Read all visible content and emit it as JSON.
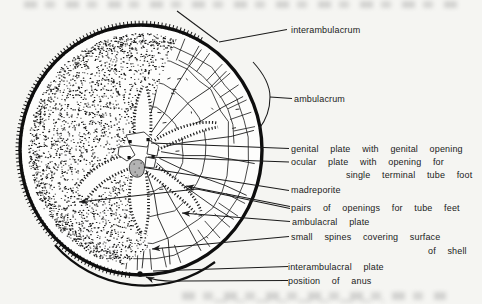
{
  "figure": {
    "type": "biological-line-diagram",
    "colors": {
      "ink": "#1b1b1b",
      "paper": "#f5f5f2",
      "shell_fill": "#fdfdfc",
      "madreporite_fill": "#b3b3b3"
    },
    "labels": {
      "interambulacrum": "interambulacrum",
      "ambulacrum": "ambulacrum",
      "genital_plate": "genital plate with genital opening",
      "ocular_plate_line1": "ocular plate with opening for",
      "ocular_plate_line2": "single terminal tube foot",
      "madreporite": "madreporite",
      "pairs_openings": "pairs of openings for tube feet",
      "ambulacral_plate": "ambulacral plate",
      "small_spines_line1": "small spines covering surface",
      "small_spines_line2": "of shell",
      "interambulacral_plate": "interambulacral plate",
      "position_of_anus": "position of anus"
    }
  }
}
